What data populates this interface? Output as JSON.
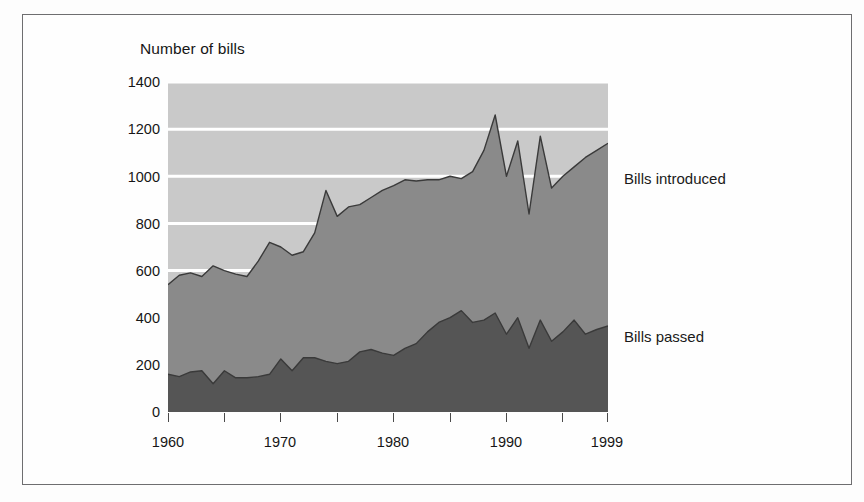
{
  "figure": {
    "y_axis_title": "Number of bills",
    "y_ticks": [
      "1400",
      "1200",
      "1000",
      "800",
      "600",
      "400",
      "200",
      "0"
    ],
    "x_ticks": [
      "1960",
      "1970",
      "1980",
      "1990",
      "1999"
    ],
    "series_labels": {
      "introduced": "Bills introduced",
      "passed": "Bills passed"
    },
    "colors": {
      "plot_background": "#c9c9c9",
      "gridline": "#ffffff",
      "introduced_fill": "#8a8a8a",
      "passed_fill": "#555555",
      "outline": "#3a3a3a",
      "frame_border": "#6e6e70",
      "text": "#161616"
    }
  },
  "chart_data": {
    "type": "area",
    "title": "",
    "subtitle": "",
    "xlabel": "",
    "ylabel": "Number of bills",
    "xlim": [
      1960,
      1999
    ],
    "ylim": [
      0,
      1400
    ],
    "ytick_values": [
      0,
      200,
      400,
      600,
      800,
      1000,
      1200,
      1400
    ],
    "xtick_values": [
      1960,
      1970,
      1980,
      1990,
      1999
    ],
    "xtick_minor_values": [
      1965,
      1975,
      1985,
      1995
    ],
    "grid": "horizontal-white",
    "legend": "inline-right-labels",
    "stacked": false,
    "x": [
      1960,
      1961,
      1962,
      1963,
      1964,
      1965,
      1966,
      1967,
      1968,
      1969,
      1970,
      1971,
      1972,
      1973,
      1974,
      1975,
      1976,
      1977,
      1978,
      1979,
      1980,
      1981,
      1982,
      1983,
      1984,
      1985,
      1986,
      1987,
      1988,
      1989,
      1990,
      1991,
      1992,
      1993,
      1994,
      1995,
      1996,
      1997,
      1998,
      1999
    ],
    "series": [
      {
        "name": "Bills introduced",
        "color": "#8a8a8a",
        "values": [
          540,
          580,
          590,
          575,
          620,
          600,
          585,
          575,
          640,
          720,
          700,
          665,
          680,
          760,
          940,
          830,
          870,
          880,
          910,
          940,
          960,
          985,
          980,
          985,
          985,
          1000,
          990,
          1020,
          1110,
          1260,
          1000,
          1150,
          840,
          1170,
          950,
          1000,
          1040,
          1080,
          1110,
          1140
        ]
      },
      {
        "name": "Bills passed",
        "color": "#555555",
        "values": [
          160,
          150,
          170,
          175,
          120,
          175,
          145,
          145,
          150,
          160,
          225,
          175,
          230,
          230,
          215,
          205,
          215,
          255,
          265,
          250,
          240,
          270,
          290,
          340,
          380,
          400,
          430,
          380,
          390,
          420,
          330,
          400,
          270,
          390,
          300,
          340,
          390,
          330,
          350,
          365
        ]
      }
    ]
  }
}
